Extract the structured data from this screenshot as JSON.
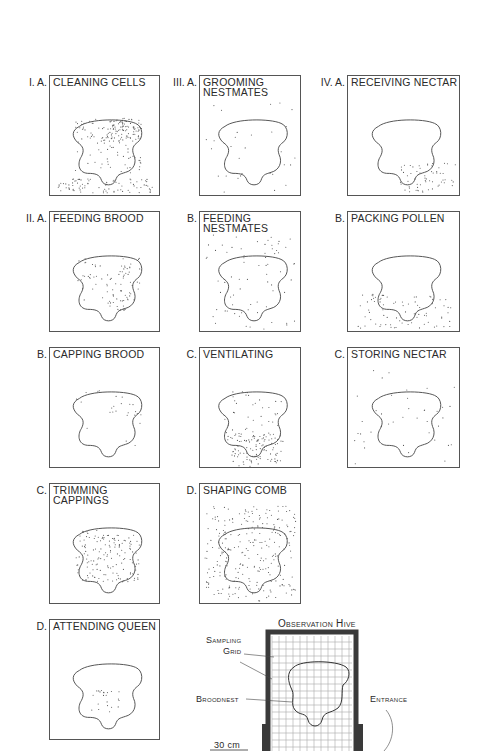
{
  "figure": {
    "panels": [
      {
        "group": "I. A.",
        "title": "CLEANING CELLS",
        "x": 49,
        "y": 75,
        "w": 111,
        "h": 121,
        "density": 260,
        "bias": "nest-upper-right-bottom"
      },
      {
        "group": "III. A.",
        "title": "GROOMING\nNESTMATES",
        "x": 199,
        "y": 75,
        "w": 102,
        "h": 121,
        "density": 30,
        "bias": "uniform"
      },
      {
        "group": "IV. A.",
        "title": "RECEIVING NECTAR",
        "x": 347,
        "y": 75,
        "w": 113,
        "h": 121,
        "density": 60,
        "bias": "bottom-right"
      },
      {
        "group": "II. A.",
        "title": "FEEDING BROOD",
        "x": 49,
        "y": 211,
        "w": 111,
        "h": 121,
        "density": 90,
        "bias": "nest-right-lower"
      },
      {
        "group": "B.",
        "title": "FEEDING\nNESTMATES",
        "x": 199,
        "y": 211,
        "w": 102,
        "h": 121,
        "density": 70,
        "bias": "uniform"
      },
      {
        "group": "B.",
        "title": "PACKING POLLEN",
        "x": 347,
        "y": 211,
        "w": 113,
        "h": 121,
        "density": 80,
        "bias": "bottom"
      },
      {
        "group": "B.",
        "title": "CAPPING BROOD",
        "x": 49,
        "y": 347,
        "w": 111,
        "h": 121,
        "density": 25,
        "bias": "nest-upper-right"
      },
      {
        "group": "C.",
        "title": "VENTILATING",
        "x": 199,
        "y": 347,
        "w": 102,
        "h": 121,
        "density": 150,
        "bias": "bottom-center"
      },
      {
        "group": "C.",
        "title": "STORING NECTAR",
        "x": 347,
        "y": 347,
        "w": 113,
        "h": 121,
        "density": 40,
        "bias": "outside"
      },
      {
        "group": "C.",
        "title": "TRIMMING\nCAPPINGS",
        "x": 49,
        "y": 483,
        "w": 111,
        "h": 121,
        "density": 150,
        "bias": "nest"
      },
      {
        "group": "D.",
        "title": "SHAPING COMB",
        "x": 199,
        "y": 483,
        "w": 102,
        "h": 121,
        "density": 260,
        "bias": "everywhere"
      },
      {
        "group": "D.",
        "title": "ATTENDING QUEEN",
        "x": 49,
        "y": 619,
        "w": 111,
        "h": 121,
        "density": 22,
        "bias": "queen"
      }
    ],
    "hive_diagram": {
      "title": "Observation Hive",
      "sampling_grid_label": "Sampling\nGrid",
      "broodnest_label": "Broodnest",
      "entrance_label": "Entrance",
      "scale_label": "30 cm"
    }
  },
  "colors": {
    "ink": "#2a2a2a",
    "frame": "#555555",
    "hive_wall": "#3a3a3a",
    "grid": "#999999"
  }
}
